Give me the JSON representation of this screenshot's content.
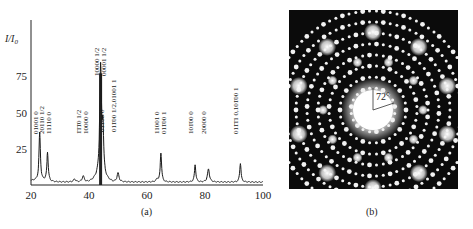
{
  "figure": {
    "panels": [
      {
        "id": "a",
        "caption": "(a)"
      },
      {
        "id": "b",
        "caption": "(b)"
      }
    ]
  },
  "chart_data": [
    {
      "type": "line",
      "title": "",
      "xlabel": "",
      "ylabel": "I/I0",
      "xlim": [
        20,
        100
      ],
      "ylim": [
        0,
        100
      ],
      "xticks": [
        "20",
        "40",
        "60",
        "80",
        "100"
      ],
      "yticks": [
        "25",
        "50",
        "75"
      ],
      "grid": false,
      "legend": null,
      "peaks": [
        {
          "x": 23.0,
          "y": 35,
          "label": "01001 0"
        },
        {
          "x": 25.7,
          "y": 22,
          "label": "20110 1/2 / 11110 0"
        },
        {
          "x": 35.0,
          "y": 4,
          "label": ""
        },
        {
          "x": 38.0,
          "y": 6,
          "label": "1̄1̄1̄0 1/2 / 10000 0"
        },
        {
          "x": 44.0,
          "y": 77,
          "label": "10000 1/2 / 00001 1/2"
        },
        {
          "x": 44.8,
          "y": 33,
          "label": "011̄00 0"
        },
        {
          "x": 50.0,
          "y": 8,
          "label": "011̄00 1/2,01001 1"
        },
        {
          "x": 63.5,
          "y": 4,
          "label": ""
        },
        {
          "x": 64.8,
          "y": 22,
          "label": "11001 0 / 011̄00 1"
        },
        {
          "x": 76.6,
          "y": 14,
          "label": "101̄00 0"
        },
        {
          "x": 81.2,
          "y": 11,
          "label": "20000 0"
        },
        {
          "x": 92.2,
          "y": 15,
          "label": "011̄1̄1 0,101̄00 1"
        },
        {
          "x": 98.0,
          "y": 2,
          "label": ""
        }
      ],
      "annotations": [
        {
          "x": 23.0,
          "lines": [
            "01001 0"
          ]
        },
        {
          "x": 25.0,
          "lines": [
            "20110 1/2",
            "11110 0"
          ]
        },
        {
          "x": 38.0,
          "lines": [
            "1̄1̄1̄0 1/2",
            "10000 0"
          ]
        },
        {
          "x": 44.0,
          "lines": [
            "10000 1/2",
            "00001 1/2"
          ]
        },
        {
          "x": 46.0,
          "lines": [
            "011̄00 0"
          ]
        },
        {
          "x": 50.0,
          "lines": [
            "011̄00 1/2,01001 1"
          ]
        },
        {
          "x": 64.8,
          "lines": [
            "11001 0",
            "011̄00 1"
          ]
        },
        {
          "x": 76.6,
          "lines": [
            "101̄00 0"
          ]
        },
        {
          "x": 81.2,
          "lines": [
            "20000 0"
          ]
        },
        {
          "x": 92.2,
          "lines": [
            "011̄1̄1 0,101̄00 1"
          ]
        }
      ]
    },
    {
      "type": "image",
      "description": "Electron diffraction pattern with tenfold symmetry",
      "annotation": "72°"
    }
  ]
}
